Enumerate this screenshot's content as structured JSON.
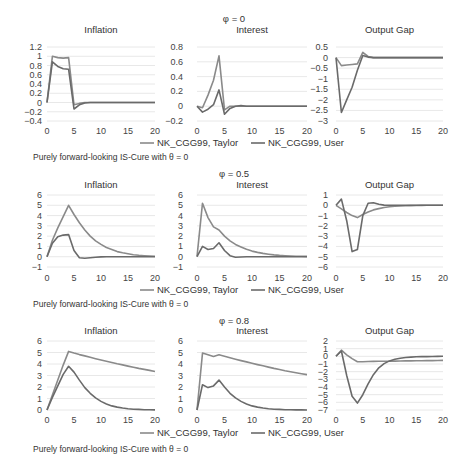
{
  "colors": {
    "taylor": "#8a8a8a",
    "user": "#6a6a6a",
    "grid": "#e2e2e2"
  },
  "legend": {
    "taylor_label": "NK_CGG99, Taylor",
    "user_label": "NK_CGG99, User"
  },
  "chart_data": [
    {
      "group_title": "φ = 0",
      "note": "Purely forward-looking IS-Cure with θ = 0",
      "panels": [
        {
          "type": "line",
          "title": "Inflation",
          "xlabel": "",
          "ylabel": "",
          "x": [
            0,
            1,
            2,
            3,
            4,
            5,
            6,
            7,
            8,
            9,
            10,
            11,
            12,
            13,
            14,
            15,
            16,
            17,
            18,
            19,
            20
          ],
          "xticks": [
            0,
            5,
            10,
            15,
            20
          ],
          "yticks": [
            1.2,
            1,
            0.8,
            0.6,
            0.4,
            0.2,
            0,
            -0.2,
            -0.4
          ],
          "ylim": [
            -0.4,
            1.2
          ],
          "series": [
            {
              "name": "NK_CGG99, Taylor",
              "values": [
                0,
                1.0,
                0.97,
                0.96,
                0.97,
                -0.05,
                -0.02,
                0,
                0,
                0,
                0,
                0,
                0,
                0,
                0,
                0,
                0,
                0,
                0,
                0,
                0
              ]
            },
            {
              "name": "NK_CGG99, User",
              "values": [
                0,
                0.88,
                0.78,
                0.73,
                0.72,
                -0.14,
                -0.05,
                -0.01,
                0,
                0,
                0,
                0,
                0,
                0,
                0,
                0,
                0,
                0,
                0,
                0,
                0
              ]
            }
          ]
        },
        {
          "type": "line",
          "title": "Interest",
          "xlabel": "",
          "ylabel": "",
          "x": [
            0,
            1,
            2,
            3,
            4,
            5,
            6,
            7,
            8,
            9,
            10,
            11,
            12,
            13,
            14,
            15,
            16,
            17,
            18,
            19,
            20
          ],
          "xticks": [
            0,
            5,
            10,
            15,
            20
          ],
          "yticks": [
            0.8,
            0.6,
            0.4,
            0.2,
            0,
            -0.2
          ],
          "ylim": [
            -0.2,
            0.8
          ],
          "series": [
            {
              "name": "NK_CGG99, Taylor",
              "values": [
                0,
                -0.02,
                0.15,
                0.35,
                0.68,
                -0.05,
                0,
                0,
                0,
                0,
                0,
                0,
                0,
                0,
                0,
                0,
                0,
                0,
                0,
                0,
                0
              ]
            },
            {
              "name": "NK_CGG99, User",
              "values": [
                0,
                -0.08,
                -0.04,
                0.02,
                0.22,
                -0.11,
                -0.03,
                0,
                0.01,
                0,
                0,
                0,
                0,
                0,
                0,
                0,
                0,
                0,
                0,
                0,
                0
              ]
            }
          ]
        },
        {
          "type": "line",
          "title": "Output Gap",
          "xlabel": "",
          "ylabel": "",
          "x": [
            0,
            1,
            2,
            3,
            4,
            5,
            6,
            7,
            8,
            9,
            10,
            11,
            12,
            13,
            14,
            15,
            16,
            17,
            18,
            19,
            20
          ],
          "xticks": [
            0,
            5,
            10,
            15,
            20
          ],
          "yticks": [
            0.5,
            0,
            -0.5,
            -1,
            -1.5,
            -2,
            -2.5,
            -3
          ],
          "ylim": [
            -3,
            0.5
          ],
          "series": [
            {
              "name": "NK_CGG99, Taylor",
              "values": [
                0,
                -0.38,
                -0.35,
                -0.33,
                -0.3,
                0.25,
                0.05,
                0,
                0,
                0,
                0,
                0,
                0,
                0,
                0,
                0,
                0,
                0,
                0,
                0,
                0
              ]
            },
            {
              "name": "NK_CGG99, User",
              "values": [
                0,
                -2.6,
                -2.0,
                -1.4,
                -0.6,
                0.1,
                0.02,
                0,
                0,
                0,
                0,
                0,
                0,
                0,
                0,
                0,
                0,
                0,
                0,
                0,
                0
              ]
            }
          ]
        }
      ]
    },
    {
      "group_title": "φ = 0.5",
      "note": "Purely forward-looking IS-Cure with θ = 0",
      "panels": [
        {
          "type": "line",
          "title": "Inflation",
          "xlabel": "",
          "ylabel": "",
          "x": [
            0,
            1,
            2,
            3,
            4,
            5,
            6,
            7,
            8,
            9,
            10,
            11,
            12,
            13,
            14,
            15,
            16,
            17,
            18,
            19,
            20
          ],
          "xticks": [
            0,
            5,
            10,
            15,
            20
          ],
          "yticks": [
            6,
            5,
            4,
            3,
            2,
            1,
            0,
            -1
          ],
          "ylim": [
            -1,
            6
          ],
          "series": [
            {
              "name": "NK_CGG99, Taylor",
              "values": [
                0,
                1.6,
                2.8,
                3.9,
                5.0,
                4.1,
                3.3,
                2.6,
                2.0,
                1.55,
                1.2,
                0.9,
                0.7,
                0.5,
                0.38,
                0.28,
                0.2,
                0.14,
                0.1,
                0.07,
                0.05
              ]
            },
            {
              "name": "NK_CGG99, User",
              "values": [
                0,
                1.3,
                1.95,
                2.1,
                2.15,
                0.6,
                -0.1,
                -0.15,
                -0.1,
                -0.05,
                -0.02,
                0,
                0,
                0,
                0,
                0,
                0,
                0,
                0,
                0,
                0
              ]
            }
          ]
        },
        {
          "type": "line",
          "title": "Interest",
          "xlabel": "",
          "ylabel": "",
          "x": [
            0,
            1,
            2,
            3,
            4,
            5,
            6,
            7,
            8,
            9,
            10,
            11,
            12,
            13,
            14,
            15,
            16,
            17,
            18,
            19,
            20
          ],
          "xticks": [
            0,
            5,
            10,
            15,
            20
          ],
          "yticks": [
            6,
            5,
            4,
            3,
            2,
            1,
            0,
            -1
          ],
          "ylim": [
            -1,
            6
          ],
          "series": [
            {
              "name": "NK_CGG99, Taylor",
              "values": [
                0,
                5.2,
                3.8,
                2.9,
                2.6,
                2.0,
                1.55,
                1.2,
                0.95,
                0.72,
                0.55,
                0.42,
                0.32,
                0.24,
                0.18,
                0.13,
                0.1,
                0.07,
                0.05,
                0.04,
                0.03
              ]
            },
            {
              "name": "NK_CGG99, User",
              "values": [
                0,
                1.0,
                0.7,
                0.8,
                1.35,
                0.6,
                0.1,
                -0.05,
                -0.03,
                0,
                0,
                0,
                0,
                0,
                0,
                0,
                0,
                0,
                0,
                0,
                0
              ]
            }
          ]
        },
        {
          "type": "line",
          "title": "Output Gap",
          "xlabel": "",
          "ylabel": "",
          "x": [
            0,
            1,
            2,
            3,
            4,
            5,
            6,
            7,
            8,
            9,
            10,
            11,
            12,
            13,
            14,
            15,
            16,
            17,
            18,
            19,
            20
          ],
          "xticks": [
            0,
            5,
            10,
            15,
            20
          ],
          "yticks": [
            1,
            0,
            -1,
            -2,
            -3,
            -4,
            -5,
            -6
          ],
          "ylim": [
            -6,
            1
          ],
          "series": [
            {
              "name": "NK_CGG99, Taylor",
              "values": [
                0,
                -0.35,
                -0.7,
                -1.0,
                -1.2,
                -0.9,
                -0.65,
                -0.45,
                -0.32,
                -0.22,
                -0.15,
                -0.1,
                -0.07,
                -0.05,
                -0.03,
                -0.02,
                -0.01,
                0,
                0,
                0,
                0
              ]
            },
            {
              "name": "NK_CGG99, User",
              "values": [
                0,
                0.6,
                -1.5,
                -4.5,
                -4.3,
                -1.0,
                0.2,
                0.25,
                0.1,
                0.02,
                0,
                0,
                0,
                0,
                0,
                0,
                0,
                0,
                0,
                0,
                0
              ]
            }
          ]
        }
      ]
    },
    {
      "group_title": "φ = 0.8",
      "note": "Purely forward-looking IS-Cure with θ = 0",
      "panels": [
        {
          "type": "line",
          "title": "Inflation",
          "xlabel": "",
          "ylabel": "",
          "x": [
            0,
            1,
            2,
            3,
            4,
            5,
            6,
            7,
            8,
            9,
            10,
            11,
            12,
            13,
            14,
            15,
            16,
            17,
            18,
            19,
            20
          ],
          "xticks": [
            0,
            5,
            10,
            15,
            20
          ],
          "yticks": [
            6,
            5,
            4,
            3,
            2,
            1,
            0
          ],
          "ylim": [
            0,
            6
          ],
          "series": [
            {
              "name": "NK_CGG99, Taylor",
              "values": [
                0,
                1.3,
                2.6,
                3.9,
                5.1,
                4.95,
                4.82,
                4.7,
                4.58,
                4.46,
                4.35,
                4.24,
                4.13,
                4.02,
                3.92,
                3.82,
                3.72,
                3.62,
                3.53,
                3.44,
                3.35
              ]
            },
            {
              "name": "NK_CGG99, User",
              "values": [
                0,
                1.1,
                2.1,
                3.1,
                3.8,
                3.3,
                2.6,
                1.95,
                1.45,
                1.05,
                0.75,
                0.52,
                0.36,
                0.25,
                0.17,
                0.11,
                0.07,
                0.05,
                0.03,
                0.02,
                0.01
              ]
            }
          ]
        },
        {
          "type": "line",
          "title": "Interest",
          "xlabel": "",
          "ylabel": "",
          "x": [
            0,
            1,
            2,
            3,
            4,
            5,
            6,
            7,
            8,
            9,
            10,
            11,
            12,
            13,
            14,
            15,
            16,
            17,
            18,
            19,
            20
          ],
          "xticks": [
            0,
            5,
            10,
            15,
            20
          ],
          "yticks": [
            6,
            5,
            4,
            3,
            2,
            1,
            0
          ],
          "ylim": [
            0,
            6
          ],
          "series": [
            {
              "name": "NK_CGG99, Taylor",
              "values": [
                0,
                4.95,
                4.8,
                4.65,
                4.8,
                4.68,
                4.55,
                4.42,
                4.3,
                4.18,
                4.06,
                3.95,
                3.84,
                3.73,
                3.62,
                3.52,
                3.42,
                3.33,
                3.24,
                3.16,
                3.08
              ]
            },
            {
              "name": "NK_CGG99, User",
              "values": [
                0,
                2.2,
                1.95,
                2.1,
                2.6,
                2.0,
                1.45,
                1.05,
                0.75,
                0.52,
                0.36,
                0.25,
                0.17,
                0.11,
                0.07,
                0.05,
                0.03,
                0.02,
                0.01,
                0.01,
                0
              ]
            }
          ]
        },
        {
          "type": "line",
          "title": "Output Gap",
          "xlabel": "",
          "ylabel": "",
          "x": [
            0,
            1,
            2,
            3,
            4,
            5,
            6,
            7,
            8,
            9,
            10,
            11,
            12,
            13,
            14,
            15,
            16,
            17,
            18,
            19,
            20
          ],
          "xticks": [
            0,
            5,
            10,
            15,
            20
          ],
          "yticks": [
            2,
            1,
            0,
            -1,
            -2,
            -3,
            -4,
            -5,
            -6,
            -7
          ],
          "ylim": [
            -7,
            2
          ],
          "series": [
            {
              "name": "NK_CGG99, Taylor",
              "values": [
                0,
                0.8,
                0.2,
                -0.3,
                -0.7,
                -0.7,
                -0.68,
                -0.66,
                -0.65,
                -0.64,
                -0.63,
                -0.62,
                -0.61,
                -0.6,
                -0.59,
                -0.58,
                -0.57,
                -0.56,
                -0.55,
                -0.54,
                -0.53
              ]
            },
            {
              "name": "NK_CGG99, User",
              "values": [
                0,
                0.7,
                -2.5,
                -5.2,
                -6.1,
                -5.0,
                -3.6,
                -2.4,
                -1.5,
                -0.95,
                -0.6,
                -0.38,
                -0.24,
                -0.15,
                -0.1,
                -0.06,
                -0.04,
                -0.03,
                -0.02,
                -0.01,
                0
              ]
            }
          ]
        }
      ]
    }
  ]
}
